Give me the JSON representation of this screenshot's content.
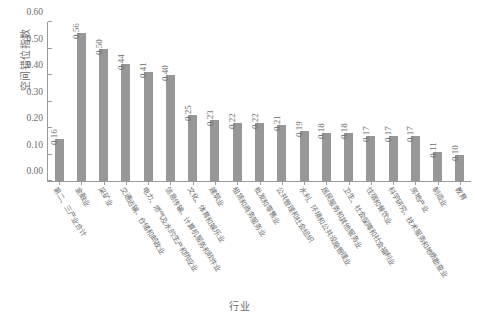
{
  "chart_data": {
    "type": "bar",
    "title": "",
    "xlabel": "行业",
    "ylabel": "空间错位指数",
    "ylim": [
      0.0,
      0.6
    ],
    "yticks": [
      "0.00",
      "0.10",
      "0.20",
      "0.30",
      "0.40",
      "0.50",
      "0.60"
    ],
    "ytick_values": [
      0.0,
      0.1,
      0.2,
      0.3,
      0.4,
      0.5,
      0.6
    ],
    "grid": false,
    "legend": "none",
    "bar_color": "#979797",
    "axis_color": "#9a9a9a",
    "text_color": "#6d6d6d",
    "categories": [
      "第二、三产业合计",
      "金融业",
      "采矿业",
      "交通运输、仓储和邮政业",
      "电力、燃气及水的生产和供应业",
      "信息传输、计算机服务和软件业",
      "文化、体育和娱乐业",
      "建筑业",
      "租赁和商务服务业",
      "批发和零售业",
      "公共管理和社会组织",
      "水利、环境和公共设施管理业",
      "居民服务和其他服务业",
      "卫生、社会保障和社会福利业",
      "住宿和餐饮业",
      "科学研究、技术服务和地质勘查业",
      "房地产业",
      "制造业",
      "教育"
    ],
    "values": [
      0.16,
      0.56,
      0.5,
      0.44,
      0.41,
      0.4,
      0.25,
      0.23,
      0.22,
      0.22,
      0.21,
      0.19,
      0.18,
      0.18,
      0.17,
      0.17,
      0.17,
      0.11,
      0.1
    ],
    "value_labels": [
      "0.16",
      "0.56",
      "0.50",
      "0.44",
      "0.41",
      "0.40",
      "0.25",
      "0.23",
      "0.22",
      "0.22",
      "0.21",
      "0.19",
      "0.18",
      "0.18",
      "0.17",
      "0.17",
      "0.17",
      "0.11",
      "0.10"
    ]
  }
}
